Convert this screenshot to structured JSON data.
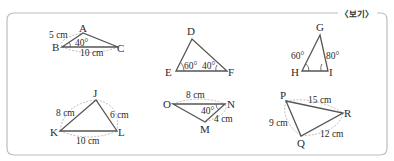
{
  "box": {
    "label": "〈보기〉"
  },
  "triangles": [
    {
      "name": "ABC",
      "vertices": {
        "A": "A",
        "B": "B",
        "C": "C"
      },
      "measures": {
        "AB": "5 cm",
        "BC": "10 cm",
        "angleB": "40°"
      }
    },
    {
      "name": "DEF",
      "vertices": {
        "D": "D",
        "E": "E",
        "F": "F"
      },
      "measures": {
        "angleE": "60°",
        "angleF": "40°"
      }
    },
    {
      "name": "GHI",
      "vertices": {
        "G": "G",
        "H": "H",
        "I": "I"
      },
      "measures": {
        "angleH": "60°",
        "angleI": "80°"
      }
    },
    {
      "name": "JKL",
      "vertices": {
        "J": "J",
        "K": "K",
        "L": "L"
      },
      "measures": {
        "JK": "8 cm",
        "JL": "6 cm",
        "KL": "10 cm"
      }
    },
    {
      "name": "OMN",
      "vertices": {
        "O": "O",
        "N": "N",
        "M": "M"
      },
      "measures": {
        "ON": "8 cm",
        "MN": "4 cm",
        "angleN": "40°"
      }
    },
    {
      "name": "PQR",
      "vertices": {
        "P": "P",
        "Q": "Q",
        "R": "R"
      },
      "measures": {
        "PR": "15 cm",
        "PQ": "9 cm",
        "QR": "12 cm"
      }
    }
  ]
}
